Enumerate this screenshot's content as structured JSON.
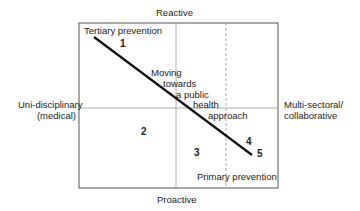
{
  "axes": {
    "top": "Reactive",
    "bottom": "Proactive",
    "left_line1": "Uni-disciplinary",
    "left_line2": "(medical)",
    "right_line1": "Multi-sectoral/",
    "right_line2": "collaborative"
  },
  "annotations": {
    "tertiary": "Tertiary prevention",
    "primary": "Primary prevention",
    "moving_1": "Moving",
    "moving_2": "towards",
    "moving_3": "a public",
    "moving_4": "health",
    "moving_5": "approach"
  },
  "points": [
    "1",
    "2",
    "3",
    "4",
    "5"
  ],
  "colors": {
    "frame": "#555555",
    "line": "#111111",
    "dashed": "#aaaaaa"
  }
}
